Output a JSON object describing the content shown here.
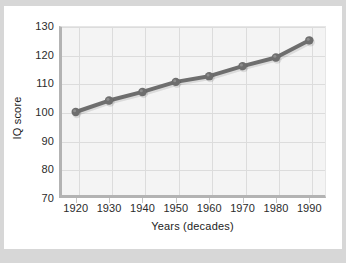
{
  "chart_data": {
    "type": "line",
    "title": "",
    "xlabel": "Years (decades)",
    "ylabel": "IQ score",
    "categories": [
      "1920",
      "1930",
      "1940",
      "1950",
      "1960",
      "1970",
      "1980",
      "1990"
    ],
    "x": [
      1920,
      1930,
      1940,
      1950,
      1960,
      1970,
      1980,
      1990
    ],
    "values": [
      100,
      104,
      107,
      110.5,
      112.5,
      116,
      119,
      125
    ],
    "series": [
      {
        "name": "IQ score",
        "values": [
          100,
          104,
          107,
          110.5,
          112.5,
          116,
          119,
          125
        ]
      }
    ],
    "xtick_labels": [
      "1920",
      "1930",
      "1940",
      "1950",
      "1960",
      "1970",
      "1980",
      "1990"
    ],
    "ytick_labels": [
      "70",
      "80",
      "90",
      "100",
      "110",
      "120",
      "130"
    ],
    "yticks": [
      70,
      80,
      90,
      100,
      110,
      120,
      130
    ],
    "ylim": [
      70,
      130
    ],
    "xlim": [
      1915,
      1995
    ],
    "grid": true,
    "legend": false,
    "legend_position": "none",
    "line_color": "#6e6e6e",
    "marker_color": "#6e6e6e",
    "plot_background": "#f4f4f4",
    "grid_color": "#dcdcdc",
    "axis_color": "#b3b3b3",
    "text_color": "#1c1c1c",
    "figure_background": "#ffffff",
    "outer_background": "#d7d7d7"
  }
}
